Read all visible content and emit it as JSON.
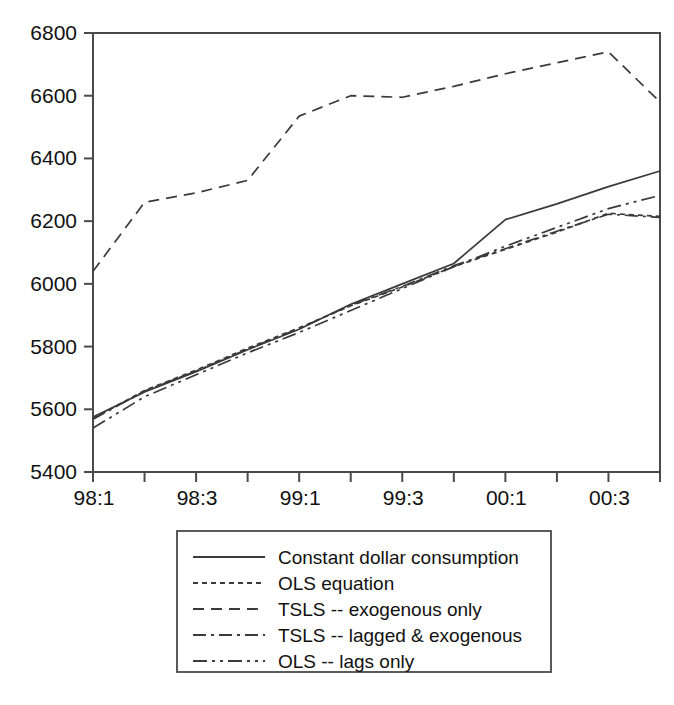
{
  "chart_data": {
    "type": "line",
    "title": "",
    "subtitle": "",
    "xlabel": "",
    "ylabel": "",
    "x": [
      "98:1",
      "98:2",
      "98:3",
      "98:4",
      "99:1",
      "99:2",
      "99:3",
      "99:4",
      "00:1",
      "00:2",
      "00:3",
      "00:4"
    ],
    "tick_labels_x": [
      "98:1",
      "",
      "98:3",
      "",
      "99:1",
      "",
      "99:3",
      "",
      "00:1",
      "",
      "00:3",
      ""
    ],
    "tick_labels_y": [
      "5400",
      "5600",
      "5800",
      "6000",
      "6200",
      "6400",
      "6600",
      "6800"
    ],
    "ylim": [
      5400,
      6800
    ],
    "ytick_values": [
      5400,
      5600,
      5800,
      6000,
      6200,
      6400,
      6600,
      6800
    ],
    "grid": false,
    "legend_position": "below-center",
    "series": [
      {
        "name": "Constant dollar consumption",
        "style": "solid",
        "dasharray": "none",
        "values": [
          5575,
          5655,
          5720,
          5790,
          5855,
          5935,
          6000,
          6065,
          6205,
          6255,
          6310,
          6360
        ]
      },
      {
        "name": "OLS equation",
        "style": "fine-dash",
        "dasharray": "5,4",
        "values": [
          5570,
          5660,
          5725,
          5795,
          5860,
          5930,
          5990,
          6055,
          6110,
          6165,
          6225,
          6215
        ]
      },
      {
        "name": "TSLS -- exogenous only",
        "style": "dash",
        "dasharray": "11,7",
        "values": [
          6040,
          6260,
          6290,
          6330,
          6535,
          6600,
          6595,
          6630,
          6670,
          6705,
          6740,
          6580
        ]
      },
      {
        "name": "TSLS -- lagged & exogenous",
        "style": "dash-dot",
        "dasharray": "13,5,3,5",
        "values": [
          5568,
          5658,
          5722,
          5792,
          5858,
          5932,
          5992,
          6058,
          6112,
          6168,
          6222,
          6212
        ]
      },
      {
        "name": "OLS -- lags only",
        "style": "dash-dot-dot",
        "dasharray": "14,5,3,5,3,5",
        "values": [
          5540,
          5640,
          5710,
          5780,
          5845,
          5915,
          5985,
          6055,
          6120,
          6180,
          6240,
          6282
        ]
      }
    ]
  },
  "legend": {
    "items": [
      {
        "label": "Constant dollar consumption",
        "style": "solid"
      },
      {
        "label": "OLS equation",
        "style": "fine-dash"
      },
      {
        "label": "TSLS -- exogenous only",
        "style": "dash"
      },
      {
        "label": "TSLS -- lagged & exogenous",
        "style": "dash-dot"
      },
      {
        "label": "OLS -- lags only",
        "style": "dash-dot-dot"
      }
    ]
  },
  "colors": {
    "line": "#3a3a3a",
    "axis": "#4a4a4a",
    "text": "#111111",
    "background": "#ffffff"
  }
}
